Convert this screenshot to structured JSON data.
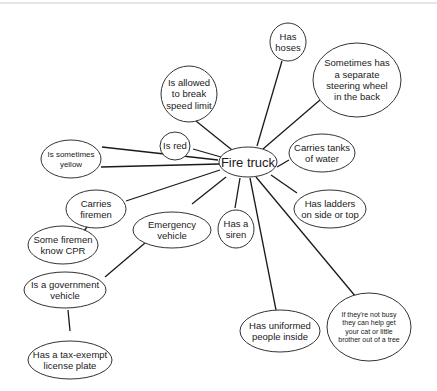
{
  "diagram": {
    "type": "concept-map",
    "center": {
      "id": "fire_truck",
      "label": "Fire truck"
    },
    "nodes": [
      {
        "id": "fire_truck",
        "lines": [
          "Fire truck"
        ],
        "cx": 248,
        "cy": 162,
        "rx": 29,
        "ry": 15,
        "fs": 13
      },
      {
        "id": "has_hoses",
        "lines": [
          "Has",
          "hoses"
        ],
        "cx": 288,
        "cy": 42,
        "rx": 18,
        "ry": 19,
        "fs": 9.5
      },
      {
        "id": "separate_steering",
        "lines": [
          "Sometimes has",
          "a separate",
          "steering wheel",
          "in the back"
        ],
        "cx": 357,
        "cy": 80,
        "rx": 44,
        "ry": 37,
        "fs": 9.5
      },
      {
        "id": "break_speed",
        "lines": [
          "Is allowed",
          "to break",
          "speed limit"
        ],
        "cx": 189,
        "cy": 94,
        "rx": 28,
        "ry": 28,
        "fs": 9.5
      },
      {
        "id": "is_red",
        "lines": [
          "Is red"
        ],
        "cx": 175,
        "cy": 146,
        "rx": 15,
        "ry": 14,
        "fs": 9.5
      },
      {
        "id": "sometimes_yellow",
        "lines": [
          "Is sometimes",
          "yellow"
        ],
        "cx": 71,
        "cy": 159,
        "rx": 30,
        "ry": 19,
        "fs": 8
      },
      {
        "id": "tanks_water",
        "lines": [
          "Carries tanks",
          "of water"
        ],
        "cx": 322,
        "cy": 153,
        "rx": 33,
        "ry": 19,
        "fs": 9.5
      },
      {
        "id": "ladders",
        "lines": [
          "Has ladders",
          "on side or top"
        ],
        "cx": 330,
        "cy": 209,
        "rx": 36,
        "ry": 19,
        "fs": 9.5
      },
      {
        "id": "carries_firemen",
        "lines": [
          "Carries",
          "firemen"
        ],
        "cx": 96,
        "cy": 209,
        "rx": 30,
        "ry": 19,
        "fs": 9.5
      },
      {
        "id": "emergency_vehicle",
        "lines": [
          "Emergency",
          "vehicle"
        ],
        "cx": 172,
        "cy": 230,
        "rx": 39,
        "ry": 18,
        "fs": 9.5
      },
      {
        "id": "siren",
        "lines": [
          "Has a",
          "siren"
        ],
        "cx": 236,
        "cy": 229,
        "rx": 18,
        "ry": 19,
        "fs": 9.5
      },
      {
        "id": "firemen_cpr",
        "lines": [
          "Some firemen",
          "know CPR"
        ],
        "cx": 63,
        "cy": 245,
        "rx": 35,
        "ry": 19,
        "fs": 9.5
      },
      {
        "id": "government_vehicle",
        "lines": [
          "Is a government",
          "vehicle"
        ],
        "cx": 65,
        "cy": 290,
        "rx": 41,
        "ry": 18,
        "fs": 9.5
      },
      {
        "id": "uniformed_people",
        "lines": [
          "Has uniformed",
          "people inside"
        ],
        "cx": 280,
        "cy": 331,
        "rx": 40,
        "ry": 21,
        "fs": 9.5
      },
      {
        "id": "cat_tree",
        "lines": [
          "If they're not busy",
          "they can help get",
          "your cat or little",
          "brother out of a tree"
        ],
        "cx": 369,
        "cy": 327,
        "rx": 42,
        "ry": 34,
        "fs": 7
      },
      {
        "id": "tax_exempt",
        "lines": [
          "Has a tax-exempt",
          "license plate"
        ],
        "cx": 70,
        "cy": 360,
        "rx": 42,
        "ry": 19,
        "fs": 9.5
      }
    ],
    "edges": [
      {
        "from": "fire_truck",
        "to": "has_hoses",
        "x1": 257,
        "y1": 146,
        "x2": 282,
        "y2": 61
      },
      {
        "from": "fire_truck",
        "to": "separate_steering",
        "x1": 263,
        "y1": 149,
        "x2": 320,
        "y2": 100
      },
      {
        "from": "fire_truck",
        "to": "break_speed",
        "x1": 232,
        "y1": 150,
        "x2": 196,
        "y2": 121
      },
      {
        "from": "fire_truck",
        "to": "is_red",
        "x1": 221,
        "y1": 157,
        "x2": 193,
        "y2": 149
      },
      {
        "from": "fire_truck",
        "to": "sometimes_yellow",
        "x1": 218,
        "y1": 160,
        "x2": 102,
        "y2": 147
      },
      {
        "from": "fire_truck",
        "to": "sometimes_yellow",
        "x1": 219,
        "y1": 164,
        "x2": 101,
        "y2": 167
      },
      {
        "from": "fire_truck",
        "to": "tanks_water",
        "x1": 277,
        "y1": 167,
        "x2": 289,
        "y2": 160
      },
      {
        "from": "fire_truck",
        "to": "ladders",
        "x1": 271,
        "y1": 175,
        "x2": 297,
        "y2": 193
      },
      {
        "from": "fire_truck",
        "to": "carries_firemen",
        "x1": 220,
        "y1": 170,
        "x2": 126,
        "y2": 201
      },
      {
        "from": "fire_truck",
        "to": "emergency_vehicle",
        "x1": 226,
        "y1": 177,
        "x2": 192,
        "y2": 204
      },
      {
        "from": "fire_truck",
        "to": "siren",
        "x1": 240,
        "y1": 178,
        "x2": 235,
        "y2": 208
      },
      {
        "from": "fire_truck",
        "to": "uniformed_people",
        "x1": 250,
        "y1": 178,
        "x2": 276,
        "y2": 310
      },
      {
        "from": "fire_truck",
        "to": "cat_tree",
        "x1": 256,
        "y1": 177,
        "x2": 356,
        "y2": 297
      },
      {
        "from": "carries_firemen",
        "to": "firemen_cpr",
        "x1": 87,
        "y1": 227,
        "x2": 80,
        "y2": 236
      },
      {
        "from": "emergency_vehicle",
        "to": "government_vehicle",
        "x1": 145,
        "y1": 243,
        "x2": 105,
        "y2": 277
      },
      {
        "from": "government_vehicle",
        "to": "tax_exempt",
        "x1": 68,
        "y1": 310,
        "x2": 70,
        "y2": 331
      }
    ]
  }
}
